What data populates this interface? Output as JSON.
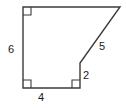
{
  "figure": {
    "kind": "polygon-diagram",
    "stroke_color": "#3b3b3b",
    "fill_color": "#ffffff",
    "label_color": "#1a1a1a",
    "stroke_width": 1.4,
    "canvas": {
      "width": 126,
      "height": 108
    },
    "vertices": [
      {
        "name": "top-left",
        "x": 23,
        "y": 7
      },
      {
        "name": "top-right",
        "x": 120,
        "y": 7
      },
      {
        "name": "notch-top",
        "x": 80,
        "y": 63
      },
      {
        "name": "notch-bottom",
        "x": 80,
        "y": 88
      },
      {
        "name": "bottom-left",
        "x": 23,
        "y": 88
      }
    ],
    "edges": [
      {
        "name": "top-edge",
        "from": "top-left",
        "to": "top-right",
        "label": ""
      },
      {
        "name": "slant-edge",
        "from": "top-right",
        "to": "notch-top",
        "label": "5"
      },
      {
        "name": "notch-edge",
        "from": "notch-top",
        "to": "notch-bottom",
        "label": "2"
      },
      {
        "name": "bottom-edge",
        "from": "notch-bottom",
        "to": "bottom-left",
        "label": "4"
      },
      {
        "name": "left-edge",
        "from": "bottom-left",
        "to": "top-left",
        "label": "6"
      }
    ],
    "right_angle_markers": [
      {
        "name": "right-angle-top-left",
        "x": 23,
        "y": 7,
        "dx": 1,
        "dy": 1,
        "size": 8
      },
      {
        "name": "right-angle-bottom-left",
        "x": 23,
        "y": 88,
        "dx": 1,
        "dy": -1,
        "size": 8
      },
      {
        "name": "right-angle-bottom-right",
        "x": 80,
        "y": 88,
        "dx": -1,
        "dy": -1,
        "size": 8
      }
    ],
    "labels": {
      "left_side": "6",
      "bottom_side": "4",
      "notch_side": "2",
      "slant_side": "5"
    }
  }
}
